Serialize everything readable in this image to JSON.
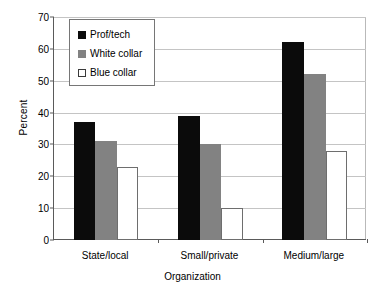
{
  "chart_data": {
    "type": "bar",
    "title": "",
    "xlabel": "Organization",
    "ylabel": "Percent",
    "categories": [
      "State/local",
      "Small/private",
      "Medium/large"
    ],
    "series": [
      {
        "name": "Prof/tech",
        "color": "#0b0b0b",
        "values": [
          37,
          39,
          62
        ]
      },
      {
        "name": "White collar",
        "color": "#828282",
        "values": [
          31,
          30,
          52
        ]
      },
      {
        "name": "Blue collar",
        "color": "#ffffff",
        "values": [
          23,
          10,
          28
        ]
      }
    ],
    "ylim": [
      0,
      70
    ],
    "yticks": [
      0,
      10,
      20,
      30,
      40,
      50,
      60,
      70
    ],
    "ytick_labels": [
      "0",
      "10",
      "20",
      "30",
      "40",
      "50",
      "60",
      "70"
    ],
    "grid": true,
    "grid_axis": "y",
    "legend_position": "upper left"
  },
  "axes": {
    "y_title": "Percent",
    "x_title": "Organization"
  }
}
